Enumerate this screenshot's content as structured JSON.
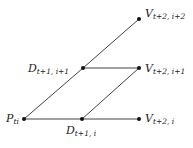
{
  "diagram": {
    "type": "binomial-tree",
    "nodes": [
      {
        "id": "P",
        "main": "P",
        "sub": "ti",
        "x": 24,
        "y": 119
      },
      {
        "id": "D1",
        "main": "D",
        "sub": "t+1, i",
        "x": 82,
        "y": 119
      },
      {
        "id": "D2",
        "main": "D",
        "sub": "t+1, i+1",
        "x": 83,
        "y": 68
      },
      {
        "id": "V0",
        "main": "V",
        "sub": "t+2, i",
        "x": 139,
        "y": 119
      },
      {
        "id": "V1",
        "main": "V",
        "sub": "t+2, i+1",
        "x": 139,
        "y": 68
      },
      {
        "id": "V2",
        "main": "V",
        "sub": "t+2, i+2",
        "x": 139,
        "y": 19
      }
    ],
    "edges": [
      [
        "P",
        "D1"
      ],
      [
        "P",
        "D2"
      ],
      [
        "D1",
        "V0"
      ],
      [
        "D1",
        "V1"
      ],
      [
        "D2",
        "V1"
      ],
      [
        "D2",
        "V2"
      ]
    ],
    "labels": {
      "p": {
        "main": "P",
        "sub": "ti"
      },
      "d1": {
        "main": "D",
        "sub": "t+1, i"
      },
      "d2": {
        "main": "D",
        "sub": "t+1, i+1"
      },
      "v0": {
        "main": "V",
        "sub": "t+2, i"
      },
      "v1": {
        "main": "V",
        "sub": "t+2, i+1"
      },
      "v2": {
        "main": "V",
        "sub": "t+2, i+2"
      }
    },
    "colors": {
      "line": "#444444",
      "node": "#111111"
    }
  }
}
